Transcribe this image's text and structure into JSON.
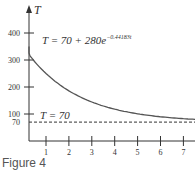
{
  "caption": "Figure 4",
  "chart_data": {
    "type": "line",
    "title": "",
    "equation_label": "T = 70 + 280e^{-0.44183t}",
    "equation_parts": {
      "base": "T = 70 + 280e",
      "exponent": "−0.44183t"
    },
    "asymptote_label": "T = 70",
    "xlabel": "",
    "ylabel": "T",
    "x_ticks": [
      "1",
      "2",
      "3",
      "4",
      "5",
      "6",
      "7"
    ],
    "y_ticks": [
      "400",
      "300",
      "200",
      "100",
      "70"
    ],
    "xlim": [
      0,
      7.5
    ],
    "ylim": [
      0,
      450
    ],
    "grid": false,
    "series": [
      {
        "name": "T(t)",
        "style": "solid",
        "x": [
          0,
          0.5,
          1,
          1.5,
          2,
          2.5,
          3,
          3.5,
          4,
          4.5,
          5,
          5.5,
          6,
          6.5,
          7,
          7.5
        ],
        "values": [
          350,
          294,
          250,
          213,
          185,
          162,
          145,
          131,
          120,
          112,
          106,
          101,
          98,
          95,
          93,
          91
        ]
      },
      {
        "name": "T = 70",
        "style": "dashed",
        "x": [
          0,
          7.5
        ],
        "values": [
          70,
          70
        ]
      }
    ]
  }
}
